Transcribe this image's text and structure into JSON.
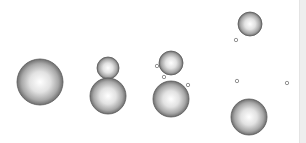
{
  "scene": {
    "background": "#ffffff",
    "sphere_style": {
      "highlight": "#ffffff",
      "mid": "#c8c8c8",
      "edge": "#6e6e6e",
      "outline": "#5a5a5a"
    },
    "spheres": [
      {
        "id": "sphere-1",
        "cx": 40,
        "cy": 82,
        "r": 23
      },
      {
        "id": "sphere-2-top",
        "cx": 108,
        "cy": 68,
        "r": 11
      },
      {
        "id": "sphere-2-bottom",
        "cx": 108,
        "cy": 96,
        "r": 18
      },
      {
        "id": "sphere-3-top",
        "cx": 171,
        "cy": 63,
        "r": 12
      },
      {
        "id": "sphere-3-bottom",
        "cx": 171,
        "cy": 99,
        "r": 18
      },
      {
        "id": "sphere-4-top",
        "cx": 250,
        "cy": 24,
        "r": 12
      },
      {
        "id": "sphere-4-bottom",
        "cx": 249,
        "cy": 117,
        "r": 18
      }
    ],
    "small_circles": [
      {
        "cx": 157,
        "cy": 66,
        "r": 1.7
      },
      {
        "cx": 164,
        "cy": 77,
        "r": 1.7
      },
      {
        "cx": 188,
        "cy": 85,
        "r": 1.7
      },
      {
        "cx": 236,
        "cy": 40,
        "r": 1.7
      },
      {
        "cx": 237,
        "cy": 81,
        "r": 1.7
      },
      {
        "cx": 287,
        "cy": 83,
        "r": 1.7
      }
    ],
    "small_circle_color": "#777777",
    "scrollbar_color": "#eeeeee"
  }
}
